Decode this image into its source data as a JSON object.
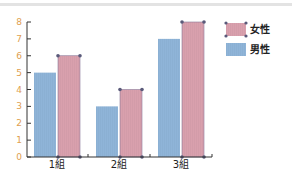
{
  "chart_data": {
    "type": "bar",
    "title": "",
    "xlabel": "",
    "ylabel": "",
    "categories": [
      "1組",
      "2組",
      "3組"
    ],
    "series": [
      {
        "name": "男性",
        "color": "#8fb4d8",
        "values": [
          5,
          3,
          7
        ]
      },
      {
        "name": "女性",
        "color": "#d9a0ad",
        "values": [
          6,
          4,
          8
        ]
      }
    ],
    "ylim": [
      0,
      8
    ],
    "yticks": [
      0,
      1,
      2,
      3,
      4,
      5,
      6,
      7,
      8
    ],
    "grid": false,
    "legend_position": "right-top",
    "legend_order": [
      "女性",
      "男性"
    ],
    "selected_series": "女性"
  },
  "colors": {
    "axis": "#333333",
    "tick_label": "#e0a050",
    "handle": "#5a5a7a"
  }
}
